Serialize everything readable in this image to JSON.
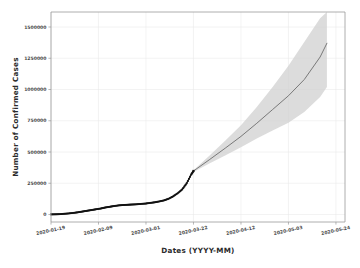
{
  "chart_data": {
    "type": "line",
    "title": "",
    "xlabel": "Dates (YYYY-MM)",
    "ylabel": "Number of Confirmed Cases",
    "grid": true,
    "legend": "none",
    "ylim": [
      -60000,
      1620000
    ],
    "yticks": [
      0,
      250000,
      500000,
      750000,
      1000000,
      1250000,
      1500000
    ],
    "ytick_labels": [
      "0",
      "250000",
      "500000",
      "750000",
      "1000000",
      "1250000",
      "1500000"
    ],
    "xticks": [
      "2020-01-19",
      "2020-02-09",
      "2020-03-01",
      "2020-03-22",
      "2020-04-12",
      "2020-05-03",
      "2020-05-24"
    ],
    "xtick_labels": [
      "2020-01-19",
      "2020-02-09",
      "2020-03-01",
      "2020-03-22",
      "2020-04-12",
      "2020-05-03",
      "2020-05-24"
    ],
    "x_range": [
      "2020-01-19",
      "2020-05-28"
    ],
    "series": [
      {
        "name": "Observed confirmed cases",
        "style": "markers",
        "color": "#111111",
        "x": [
          "2020-01-19",
          "2020-01-21",
          "2020-01-23",
          "2020-01-25",
          "2020-01-27",
          "2020-01-29",
          "2020-01-31",
          "2020-02-02",
          "2020-02-04",
          "2020-02-06",
          "2020-02-08",
          "2020-02-10",
          "2020-02-12",
          "2020-02-14",
          "2020-02-16",
          "2020-02-18",
          "2020-02-20",
          "2020-02-22",
          "2020-02-24",
          "2020-02-26",
          "2020-02-28",
          "2020-03-01",
          "2020-03-03",
          "2020-03-05",
          "2020-03-07",
          "2020-03-09",
          "2020-03-11",
          "2020-03-13",
          "2020-03-15",
          "2020-03-17",
          "2020-03-19",
          "2020-03-21",
          "2020-03-22"
        ],
        "values": [
          800,
          1500,
          3000,
          6000,
          9000,
          13000,
          18000,
          24000,
          30000,
          36000,
          42000,
          48000,
          56000,
          62000,
          68000,
          73000,
          76000,
          78000,
          80000,
          82000,
          85000,
          88000,
          93000,
          98000,
          105000,
          113000,
          126000,
          145000,
          170000,
          200000,
          250000,
          320000,
          348000
        ]
      },
      {
        "name": "Forecast",
        "style": "line",
        "color": "#6d6d6d",
        "x": [
          "2020-03-22",
          "2020-03-29",
          "2020-04-05",
          "2020-04-12",
          "2020-04-19",
          "2020-04-26",
          "2020-05-03",
          "2020-05-10",
          "2020-05-17",
          "2020-05-20"
        ],
        "values": [
          348000,
          438000,
          530000,
          625000,
          730000,
          840000,
          950000,
          1080000,
          1260000,
          1370000
        ]
      }
    ],
    "confidence_band": {
      "name": "Forecast confidence interval",
      "color": "#d0d0d0",
      "opacity": 0.75,
      "x": [
        "2020-03-22",
        "2020-03-29",
        "2020-04-05",
        "2020-04-12",
        "2020-04-19",
        "2020-04-26",
        "2020-05-03",
        "2020-05-10",
        "2020-05-17",
        "2020-05-20"
      ],
      "upper": [
        355000,
        470000,
        590000,
        715000,
        860000,
        1020000,
        1190000,
        1380000,
        1570000,
        1620000
      ],
      "lower": [
        341000,
        408000,
        472000,
        538000,
        608000,
        672000,
        735000,
        820000,
        940000,
        1020000
      ]
    }
  }
}
